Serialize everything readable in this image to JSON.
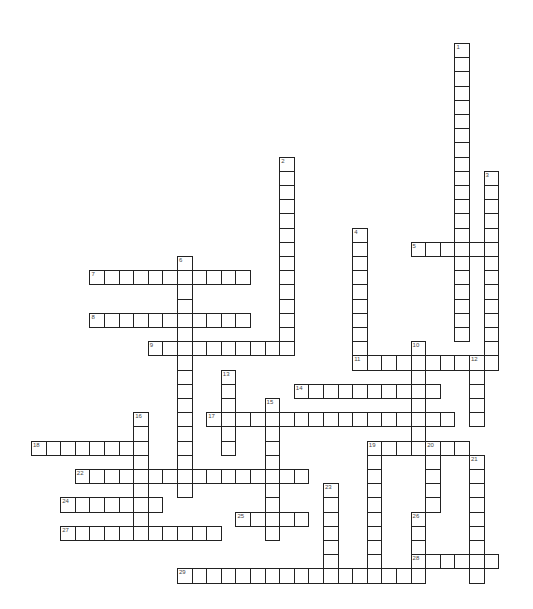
{
  "puzzle": {
    "type": "crossword",
    "layout": {
      "origin_x": 31,
      "origin_y": 43,
      "cell_step_x": 14.6,
      "cell_step_y": 14.2,
      "border_color": "#222222",
      "background_color": "#ffffff"
    },
    "entries": [
      {
        "number": "1",
        "direction": "down",
        "col": 29,
        "row": 0,
        "length": 21
      },
      {
        "number": "2",
        "direction": "down",
        "col": 17,
        "row": 8,
        "length": 14
      },
      {
        "number": "3",
        "direction": "down",
        "col": 31,
        "row": 9,
        "length": 14
      },
      {
        "number": "4",
        "direction": "down",
        "col": 22,
        "row": 13,
        "length": 10
      },
      {
        "number": "5",
        "direction": "across",
        "col": 26,
        "row": 14,
        "length": 6
      },
      {
        "number": "6",
        "direction": "down",
        "col": 10,
        "row": 15,
        "length": 17
      },
      {
        "number": "7",
        "direction": "across",
        "col": 4,
        "row": 16,
        "length": 11
      },
      {
        "number": "8",
        "direction": "across",
        "col": 4,
        "row": 19,
        "length": 11
      },
      {
        "number": "9",
        "direction": "across",
        "col": 8,
        "row": 21,
        "length": 10
      },
      {
        "number": "10",
        "direction": "down",
        "col": 26,
        "row": 21,
        "length": 8
      },
      {
        "number": "11",
        "direction": "across",
        "col": 22,
        "row": 22,
        "length": 10
      },
      {
        "number": "12",
        "direction": "down",
        "col": 30,
        "row": 22,
        "length": 5
      },
      {
        "number": "13",
        "direction": "down",
        "col": 13,
        "row": 23,
        "length": 6
      },
      {
        "number": "14",
        "direction": "across",
        "col": 18,
        "row": 24,
        "length": 10
      },
      {
        "number": "15",
        "direction": "down",
        "col": 16,
        "row": 25,
        "length": 10
      },
      {
        "number": "16",
        "direction": "down",
        "col": 7,
        "row": 26,
        "length": 9
      },
      {
        "number": "17",
        "direction": "across",
        "col": 12,
        "row": 26,
        "length": 17
      },
      {
        "number": "18",
        "direction": "across",
        "col": 0,
        "row": 28,
        "length": 8
      },
      {
        "number": "19",
        "direction": "across",
        "col": 23,
        "row": 28,
        "length": 7
      },
      {
        "number": "19",
        "direction": "down",
        "col": 23,
        "row": 28,
        "length": 10
      },
      {
        "number": "20",
        "direction": "down",
        "col": 27,
        "row": 28,
        "length": 5
      },
      {
        "number": "21",
        "direction": "down",
        "col": 30,
        "row": 29,
        "length": 9
      },
      {
        "number": "22",
        "direction": "across",
        "col": 3,
        "row": 30,
        "length": 16
      },
      {
        "number": "23",
        "direction": "down",
        "col": 20,
        "row": 31,
        "length": 6
      },
      {
        "number": "24",
        "direction": "across",
        "col": 2,
        "row": 32,
        "length": 7
      },
      {
        "number": "25",
        "direction": "across",
        "col": 14,
        "row": 33,
        "length": 5
      },
      {
        "number": "26",
        "direction": "down",
        "col": 26,
        "row": 33,
        "length": 5
      },
      {
        "number": "27",
        "direction": "across",
        "col": 2,
        "row": 34,
        "length": 11
      },
      {
        "number": "28",
        "direction": "across",
        "col": 26,
        "row": 36,
        "length": 6
      },
      {
        "number": "29",
        "direction": "across",
        "col": 10,
        "row": 37,
        "length": 17
      }
    ]
  }
}
